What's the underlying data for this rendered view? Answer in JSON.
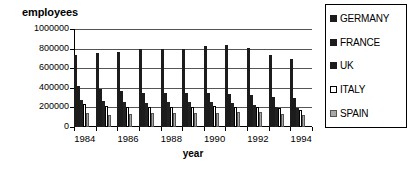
{
  "chart_data": {
    "type": "bar",
    "title": "",
    "ylabel": "employees",
    "xlabel": "year",
    "ylim": [
      0,
      1000000
    ],
    "yticks": [
      0,
      200000,
      400000,
      600000,
      800000,
      1000000
    ],
    "ytick_labels": [
      "0",
      "200000",
      "400000",
      "600000",
      "800000",
      "1000000"
    ],
    "grid": true,
    "legend_position": "right",
    "categories": [
      1984,
      1985,
      1986,
      1987,
      1988,
      1989,
      1990,
      1991,
      1992,
      1993,
      1994
    ],
    "xtick_labels": [
      "1984",
      "1986",
      "1988",
      "1990",
      "1992",
      "1994"
    ],
    "series": [
      {
        "name": "GERMANY",
        "color": "#1c1c1c",
        "values": [
          735000,
          755000,
          770000,
          800000,
          800000,
          800000,
          825000,
          835000,
          805000,
          730000,
          690000
        ]
      },
      {
        "name": "FRANCE",
        "color": "#1c1c1c",
        "values": [
          420000,
          390000,
          365000,
          350000,
          345000,
          345000,
          345000,
          340000,
          325000,
          305000,
          300000
        ]
      },
      {
        "name": "UK",
        "color": "#222222",
        "values": [
          280000,
          270000,
          255000,
          245000,
          255000,
          260000,
          255000,
          240000,
          225000,
          200000,
          195000
        ]
      },
      {
        "name": "ITALY",
        "color": "#ffffff",
        "values": [
          230000,
          215000,
          205000,
          200000,
          200000,
          200000,
          210000,
          205000,
          200000,
          190000,
          175000
        ]
      },
      {
        "name": "SPAIN",
        "color": "#a8a8a8",
        "values": [
          140000,
          125000,
          130000,
          140000,
          140000,
          140000,
          145000,
          150000,
          150000,
          130000,
          125000
        ]
      }
    ]
  },
  "legend": {
    "items": [
      {
        "label": "GERMANY",
        "swatch": "black-square-icon"
      },
      {
        "label": "FRANCE",
        "swatch": "black-square-icon"
      },
      {
        "label": "UK",
        "swatch": "black-square-icon"
      },
      {
        "label": "ITALY",
        "swatch": "white-square-icon"
      },
      {
        "label": "SPAIN",
        "swatch": "gray-square-icon"
      }
    ]
  }
}
